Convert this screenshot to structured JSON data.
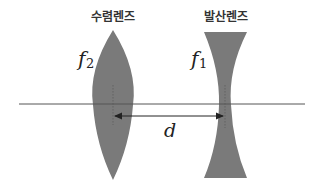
{
  "diagram": {
    "type": "optics-lens-system",
    "colors": {
      "background": "#ffffff",
      "lens_fill": "#7a7a7a",
      "axis": "#555555",
      "arrow": "#222222",
      "text": "#222222"
    },
    "converging_lens": {
      "label": "수렴렌즈",
      "focal_symbol": "f",
      "focal_subscript": "2"
    },
    "diverging_lens": {
      "label": "발산렌즈",
      "focal_symbol": "f",
      "focal_subscript": "1"
    },
    "separation": {
      "label": "d"
    },
    "optical_axis": {
      "label": ""
    }
  }
}
